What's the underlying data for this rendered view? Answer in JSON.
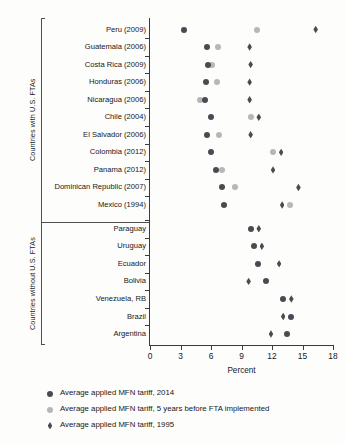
{
  "chart_data": {
    "type": "scatter",
    "title": "",
    "xlabel": "Percent",
    "ylabel": "",
    "xlim": [
      0,
      18
    ],
    "xticks": [
      0,
      3,
      6,
      9,
      12,
      15,
      18
    ],
    "xticklabels": [
      "0",
      "3",
      "6",
      "9",
      "12",
      "15",
      "18"
    ],
    "grid": false,
    "legend_position": "below",
    "groups": [
      {
        "name": "Countries with U.S. FTAs",
        "categories": [
          "Peru (2009)",
          "Guatemala (2006)",
          "Costa Rica (2009)",
          "Honduras (2006)",
          "Nicaragua (2006)",
          "Chile (2004)",
          "El Salvador (2006)",
          "Colombia (2012)",
          "Panama (2012)",
          "Dominican Republic (2007)",
          "Mexico (1994)"
        ]
      },
      {
        "name": "Countries without U.S. FTAs",
        "categories": [
          "Paraguay",
          "Uruguay",
          "Ecuador",
          "Bolivia",
          "Venezuela, RB",
          "Brazil",
          "Argentina"
        ]
      }
    ],
    "series": [
      {
        "name": "Average applied MFN tariff, 2014",
        "marker": "circle",
        "color": "#4a4a52",
        "values": [
          3.3,
          5.6,
          5.7,
          5.5,
          5.4,
          6.0,
          5.6,
          6.0,
          6.5,
          7.1,
          7.3,
          9.9,
          10.2,
          10.6,
          11.4,
          13.1,
          13.9,
          13.5
        ]
      },
      {
        "name": "Average applied MFN tariff, 5 years before FTA implemented",
        "marker": "circle",
        "color": "#b7b7b7",
        "values": [
          10.5,
          6.7,
          6.1,
          6.6,
          4.9,
          9.9,
          6.8,
          12.1,
          7.1,
          8.4,
          13.8,
          null,
          null,
          null,
          null,
          null,
          null,
          null
        ]
      },
      {
        "name": "Average applied MFN tariff, 1995",
        "marker": "diamond",
        "color": "#4a4a52",
        "values": [
          16.3,
          9.8,
          9.9,
          9.8,
          9.8,
          10.7,
          9.9,
          12.9,
          12.1,
          14.6,
          13.0,
          10.7,
          11.0,
          12.7,
          9.7,
          13.9,
          13.1,
          11.9
        ]
      }
    ],
    "rows": [
      {
        "label": "Peru (2009)",
        "group": 0,
        "dark": 3.3,
        "light": 10.5,
        "diamond": 16.3
      },
      {
        "label": "Guatemala (2006)",
        "group": 0,
        "dark": 5.6,
        "light": 6.7,
        "diamond": 9.8
      },
      {
        "label": "Costa Rica (2009)",
        "group": 0,
        "dark": 5.7,
        "light": 6.1,
        "diamond": 9.9
      },
      {
        "label": "Honduras (2006)",
        "group": 0,
        "dark": 5.5,
        "light": 6.6,
        "diamond": 9.8
      },
      {
        "label": "Nicaragua (2006)",
        "group": 0,
        "dark": 5.4,
        "light": 4.9,
        "diamond": 9.8
      },
      {
        "label": "Chile (2004)",
        "group": 0,
        "dark": 6.0,
        "light": 9.9,
        "diamond": 10.7
      },
      {
        "label": "El Salvador (2006)",
        "group": 0,
        "dark": 5.6,
        "light": 6.8,
        "diamond": 9.9
      },
      {
        "label": "Colombia (2012)",
        "group": 0,
        "dark": 6.0,
        "light": 12.1,
        "diamond": 12.9
      },
      {
        "label": "Panama (2012)",
        "group": 0,
        "dark": 6.5,
        "light": 7.1,
        "diamond": 12.1
      },
      {
        "label": "Dominican Republic (2007)",
        "group": 0,
        "dark": 7.1,
        "light": 8.4,
        "diamond": 14.6
      },
      {
        "label": "Mexico (1994)",
        "group": 0,
        "dark": 7.3,
        "light": 13.8,
        "diamond": 13.0
      },
      {
        "label": "Paraguay",
        "group": 1,
        "dark": 9.9,
        "light": null,
        "diamond": 10.7
      },
      {
        "label": "Uruguay",
        "group": 1,
        "dark": 10.2,
        "light": null,
        "diamond": 11.0
      },
      {
        "label": "Ecuador",
        "group": 1,
        "dark": 10.6,
        "light": null,
        "diamond": 12.7
      },
      {
        "label": "Bolivia",
        "group": 1,
        "dark": 11.4,
        "light": null,
        "diamond": 9.7
      },
      {
        "label": "Venezuela, RB",
        "group": 1,
        "dark": 13.1,
        "light": null,
        "diamond": 13.9
      },
      {
        "label": "Brazil",
        "group": 1,
        "dark": 13.9,
        "light": null,
        "diamond": 13.1
      },
      {
        "label": "Argentina",
        "group": 1,
        "dark": 13.5,
        "light": null,
        "diamond": 11.9
      }
    ],
    "legend": [
      {
        "marker": "circle",
        "color": "#4a4a52",
        "label": "Average applied MFN tariff, 2014"
      },
      {
        "marker": "circle",
        "color": "#b7b7b7",
        "label": "Average applied MFN tariff, 5 years before FTA implemented"
      },
      {
        "marker": "diamond",
        "color": "#4a4a52",
        "label": "Average applied MFN tariff, 1995"
      }
    ]
  },
  "axis": {
    "x_title": "Percent"
  },
  "group_labels": {
    "with": "Countries with U.S. FTAs",
    "without": "Countries without U.S. FTAs"
  }
}
